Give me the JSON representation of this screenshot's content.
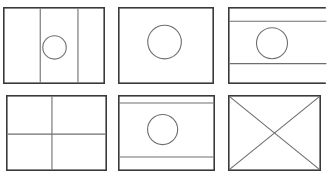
{
  "page": {
    "background_color": "#ffffff",
    "width": 324,
    "height": 180
  },
  "style": {
    "border_color": "#3a3a3a",
    "detail_color": "#6e6e6e",
    "circle_color": "#6e6e6e",
    "fill_color": "#ffffff",
    "border_width": 1.6,
    "detail_width": 1.1,
    "circle_width": 1.1
  },
  "grid": {
    "rows": 2,
    "columns": 3,
    "row_labels": [
      "row-1",
      "row-2"
    ],
    "column_labels": [
      "column-1",
      "column-2",
      "column-3"
    ]
  },
  "flags": [
    {
      "id": "flag-1",
      "name": "vertical-triband-with-disc",
      "position": "row-1-column-1",
      "x": 3,
      "y": 7,
      "width": 102,
      "height": 77,
      "cropped": false,
      "pattern": "vertical-triband",
      "emblem": "circle",
      "vertical_dividers": [
        0.365,
        0.735
      ],
      "horizontal_dividers": [],
      "diagonals": [],
      "circle": {
        "cx": 0.505,
        "cy": 0.525,
        "r": 0.115
      }
    },
    {
      "id": "flag-2",
      "name": "plain-field-with-disc",
      "position": "row-1-column-2",
      "x": 118,
      "y": 7,
      "width": 96,
      "height": 77,
      "cropped": false,
      "pattern": "plain",
      "emblem": "circle",
      "vertical_dividers": [],
      "horizontal_dividers": [],
      "diagonals": [],
      "circle": {
        "cx": 0.485,
        "cy": 0.455,
        "r": 0.175
      }
    },
    {
      "id": "flag-3",
      "name": "horizontal-triband-with-disc-cropped",
      "position": "row-1-column-3",
      "x": 228,
      "y": 7,
      "width": 100,
      "height": 77,
      "cropped": true,
      "pattern": "horizontal-triband",
      "emblem": "circle",
      "vertical_dividers": [],
      "horizontal_dividers": [
        0.185,
        0.735
      ],
      "diagonals": [],
      "circle": {
        "cx": 0.44,
        "cy": 0.47,
        "r": 0.155
      }
    },
    {
      "id": "flag-4",
      "name": "quartered-cross-division",
      "position": "row-2-column-1",
      "x": 6,
      "y": 95,
      "width": 101,
      "height": 76,
      "cropped": false,
      "pattern": "cross-quartered",
      "emblem": "none",
      "vertical_dividers": [
        0.455
      ],
      "horizontal_dividers": [
        0.515
      ],
      "diagonals": [],
      "circle": null
    },
    {
      "id": "flag-5",
      "name": "horizontal-triband-with-disc",
      "position": "row-2-column-2",
      "x": 118,
      "y": 95,
      "width": 97,
      "height": 76,
      "cropped": false,
      "pattern": "horizontal-triband",
      "emblem": "circle",
      "vertical_dividers": [],
      "horizontal_dividers": [
        0.105,
        0.815
      ],
      "diagonals": [],
      "circle": {
        "cx": 0.46,
        "cy": 0.455,
        "r": 0.155
      }
    },
    {
      "id": "flag-6",
      "name": "saltire-diagonal-cross",
      "position": "row-2-column-3",
      "x": 228,
      "y": 95,
      "width": 93,
      "height": 76,
      "cropped": false,
      "pattern": "saltire",
      "emblem": "none",
      "vertical_dividers": [],
      "horizontal_dividers": [],
      "diagonals": [
        "top-left-to-bottom-right",
        "bottom-left-to-top-right"
      ],
      "circle": null
    }
  ]
}
